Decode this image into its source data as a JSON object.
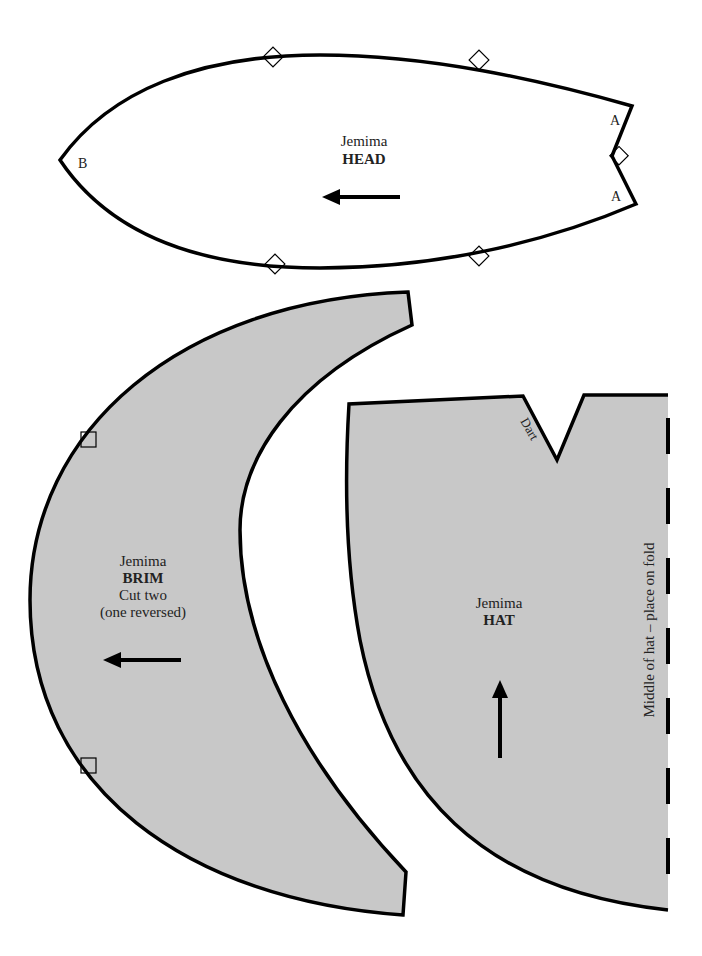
{
  "colors": {
    "piece_fill": "#c8c8c8",
    "outline": "#000000",
    "background": "#ffffff"
  },
  "head": {
    "name": "Jemima",
    "title": "HEAD",
    "point_a_top": "A",
    "point_a_bottom": "A",
    "point_b": "B",
    "grain_arrow": "arrow-left"
  },
  "brim": {
    "name": "Jemima",
    "title": "BRIM",
    "instruction_1": "Cut two",
    "instruction_2": "(one reversed)",
    "grain_arrow": "arrow-left"
  },
  "hat": {
    "name": "Jemima",
    "title": "HAT",
    "dart_label": "Dart",
    "fold_label": "Middle of hat – place on fold",
    "grain_arrow": "arrow-up"
  }
}
